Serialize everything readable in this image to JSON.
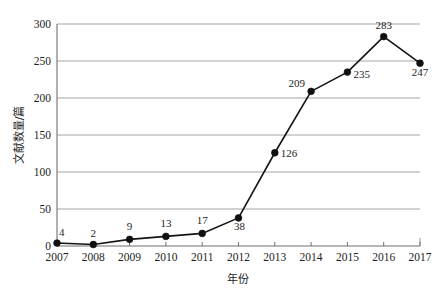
{
  "chart_data": {
    "type": "line",
    "title": "",
    "xlabel": "年份",
    "ylabel": "文献数量/篇",
    "categories": [
      "2007",
      "2008",
      "2009",
      "2010",
      "2011",
      "2012",
      "2013",
      "2014",
      "2015",
      "2016",
      "2017"
    ],
    "values": [
      4,
      2,
      9,
      13,
      17,
      38,
      126,
      209,
      235,
      283,
      247
    ],
    "series": [
      {
        "name": "文献数量",
        "values": [
          4,
          2,
          9,
          13,
          17,
          38,
          126,
          209,
          235,
          283,
          247
        ]
      }
    ],
    "point_labels": [
      "4",
      "2",
      "9",
      "13",
      "17",
      "38",
      "126",
      "209",
      "235",
      "283",
      "247"
    ],
    "yticks": [
      0,
      50,
      100,
      150,
      200,
      250,
      300
    ],
    "ytick_labels": [
      "0",
      "50",
      "100",
      "150",
      "200",
      "250",
      "300"
    ],
    "ylim": [
      0,
      300
    ],
    "xlim": [
      "2007",
      "2017"
    ],
    "grid": "horizontal",
    "legend": "none",
    "marker": "filled-circle",
    "line_color": "#141414",
    "marker_color": "#101010",
    "grid_color": "#9a9a9a",
    "background_color": "#ffffff"
  }
}
